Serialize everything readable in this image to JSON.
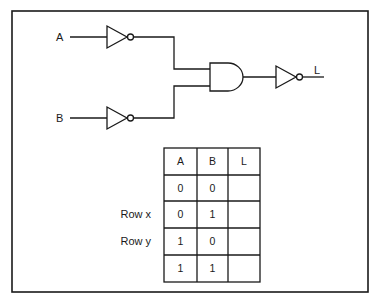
{
  "diagram": {
    "type": "logic-circuit",
    "inputs": [
      {
        "label": "A",
        "gate": "NOT"
      },
      {
        "label": "B",
        "gate": "NOT"
      }
    ],
    "middle_gate": "AND",
    "output_gate": "NOT",
    "output_label": "L",
    "expression": "L = NOT( (NOT A) AND (NOT B) )"
  },
  "truth_table": {
    "headers": [
      "A",
      "B",
      "L"
    ],
    "rows": [
      {
        "row_label": "",
        "A": "0",
        "B": "0",
        "L": ""
      },
      {
        "row_label": "Row x",
        "A": "0",
        "B": "1",
        "L": ""
      },
      {
        "row_label": "Row y",
        "A": "1",
        "B": "0",
        "L": ""
      },
      {
        "row_label": "",
        "A": "1",
        "B": "1",
        "L": ""
      }
    ]
  },
  "colors": {
    "stroke": "#1a1a1a",
    "background": "#ffffff"
  }
}
